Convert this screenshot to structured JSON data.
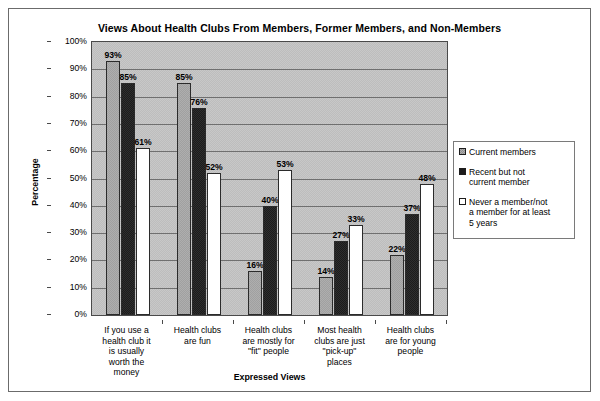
{
  "chart_data": {
    "type": "bar",
    "title": "Views About Health Clubs From Members, Former Members, and Non-Members",
    "xlabel": "Expressed Views",
    "ylabel": "Percentage",
    "ylim": [
      0,
      100
    ],
    "ytick_labels": [
      "100%",
      "90%",
      "80%",
      "70%",
      "60%",
      "50%",
      "40%",
      "30%",
      "20%",
      "10%",
      "0%"
    ],
    "grid": true,
    "legend_position": "right",
    "categories": [
      "If you use a health club it is usually worth the money",
      "Health clubs are fun",
      "Health clubs are mostly for \"fit\" people",
      "Most health clubs are just \"pick-up\" places",
      "Health clubs are for young people"
    ],
    "category_lines": [
      [
        "If you use a",
        "health club it",
        "is usually",
        "worth the",
        "money"
      ],
      [
        "Health clubs",
        "are fun"
      ],
      [
        "Health clubs",
        "are mostly for",
        "\"fit\" people"
      ],
      [
        "Most health",
        "clubs are just",
        "\"pick-up\"",
        "places"
      ],
      [
        "Health clubs",
        "are for young",
        "people"
      ]
    ],
    "series": [
      {
        "name": "Current members",
        "legend_label": "Current members",
        "color": "#aeaeae",
        "values": [
          93,
          85,
          16,
          14,
          22
        ],
        "value_labels": [
          "93%",
          "85%",
          "16%",
          "14%",
          "22%"
        ]
      },
      {
        "name": "Recent but not current member",
        "legend_label": "Recent but not\ncurrent member",
        "color": "#1c1c1c",
        "values": [
          85,
          76,
          40,
          27,
          37
        ],
        "value_labels": [
          "85%",
          "76%",
          "40%",
          "27%",
          "37%"
        ]
      },
      {
        "name": "Never a member/not a member for at least 5 years",
        "legend_label": "Never a member/not\na member for at least\n5 years",
        "color": "#ffffff",
        "values": [
          61,
          52,
          53,
          33,
          48
        ],
        "value_labels": [
          "61%",
          "52%",
          "53%",
          "33%",
          "48%"
        ]
      }
    ]
  },
  "series_order_note": {
    "group1": [
      "93%",
      "85%",
      "61%"
    ],
    "group2": [
      "78%",
      "76%",
      "52%"
    ],
    "group3": [
      "16%",
      "40%",
      "53%"
    ],
    "group4": [
      "14%",
      "27%",
      "33%"
    ],
    "group5": [
      "22%",
      "37%",
      "48%"
    ]
  }
}
